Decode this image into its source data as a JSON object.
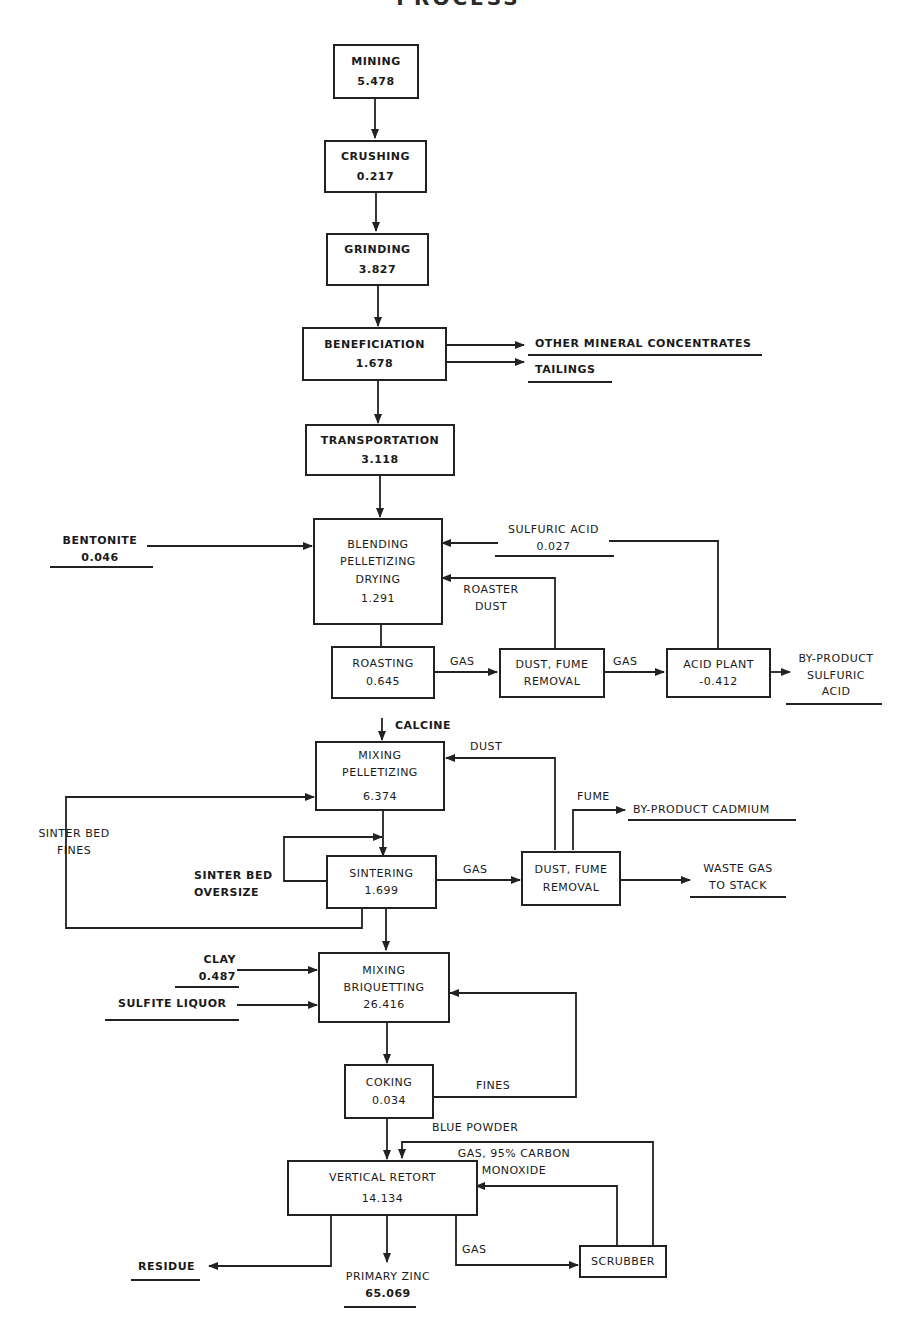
{
  "title": "PROCESS",
  "boxes": {
    "mining": {
      "name": "MINING",
      "value": "5.478"
    },
    "crushing": {
      "name": "CRUSHING",
      "value": "0.217"
    },
    "grinding": {
      "name": "GRINDING",
      "value": "3.827"
    },
    "beneficiation": {
      "name": "BENEFICIATION",
      "value": "1.678"
    },
    "transportation": {
      "name": "TRANSPORTATION",
      "value": "3.118"
    },
    "blending": {
      "line1": "BLENDING",
      "line2": "PELLETIZING",
      "line3": "DRYING",
      "value": "1.291"
    },
    "roasting": {
      "name": "ROASTING",
      "value": "0.645"
    },
    "dust_fume_1": {
      "line1": "DUST, FUME",
      "line2": "REMOVAL"
    },
    "acid_plant": {
      "name": "ACID PLANT",
      "value": "-0.412"
    },
    "mixing_pelletizing": {
      "line1": "MIXING",
      "line2": "PELLETIZING",
      "value": "6.374"
    },
    "sintering": {
      "name": "SINTERING",
      "value": "1.699"
    },
    "dust_fume_2": {
      "line1": "DUST, FUME",
      "line2": "REMOVAL"
    },
    "mixing_briquetting": {
      "line1": "MIXING",
      "line2": "BRIQUETTING",
      "value": "26.416"
    },
    "coking": {
      "name": "COKING",
      "value": "0.034"
    },
    "vertical_retort": {
      "name": "VERTICAL RETORT",
      "value": "14.134"
    },
    "scrubber": {
      "name": "SCRUBBER"
    }
  },
  "labels": {
    "other_mineral_concentrates": "OTHER MINERAL CONCENTRATES",
    "tailings": "TAILINGS",
    "bentonite": {
      "name": "BENTONITE",
      "value": "0.046"
    },
    "sulfuric_acid": {
      "name": "SULFURIC ACID",
      "value": "0.027"
    },
    "roaster_dust": {
      "line1": "ROASTER",
      "line2": "DUST"
    },
    "gas_roasting": "GAS",
    "gas_acid": "GAS",
    "byproduct_sulfuric": {
      "line1": "BY-PRODUCT",
      "line2": "SULFURIC",
      "line3": "ACID"
    },
    "calcine": "CALCINE",
    "dust": "DUST",
    "fume": "FUME",
    "byproduct_cadmium": "BY-PRODUCT CADMIUM",
    "sinter_bed_fines": {
      "line1": "SINTER BED",
      "line2": "FINES"
    },
    "sinter_bed_oversize": {
      "line1": "SINTER BED",
      "line2": "OVERSIZE"
    },
    "gas_sintering": "GAS",
    "waste_gas": {
      "line1": "WASTE GAS",
      "line2": "TO STACK"
    },
    "clay": {
      "name": "CLAY",
      "value": "0.487"
    },
    "sulfite_liquor": "SULFITE LIQUOR",
    "fines": "FINES",
    "blue_powder": "BLUE POWDER",
    "gas_co": {
      "line1": "GAS, 95% CARBON",
      "line2": "MONOXIDE"
    },
    "gas_retort": "GAS",
    "residue": "RESIDUE",
    "primary_zinc": {
      "name": "PRIMARY ZINC",
      "value": "65.069"
    }
  }
}
